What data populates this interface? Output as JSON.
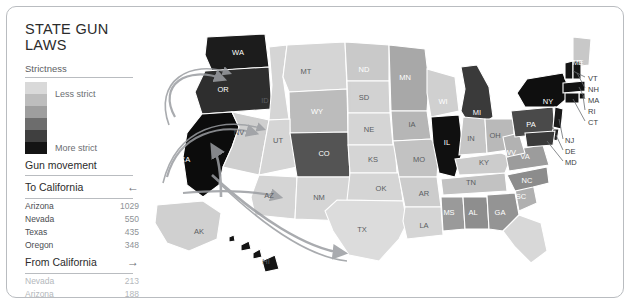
{
  "title": "STATE GUN LAWS",
  "legend": {
    "heading": "Strictness",
    "less_label": "Less strict",
    "more_label": "More strict",
    "ramp_colors": [
      "#d9d9d9",
      "#bdbdbd",
      "#9e9e9e",
      "#6d6d6d",
      "#3f3f3f",
      "#141414"
    ]
  },
  "movement": {
    "heading": "Gun movement",
    "to": {
      "label": "To California",
      "arrow": "←",
      "rows": [
        {
          "name": "Arizona",
          "value": "1029"
        },
        {
          "name": "Nevada",
          "value": "550"
        },
        {
          "name": "Texas",
          "value": "435"
        },
        {
          "name": "Oregon",
          "value": "348"
        }
      ]
    },
    "from": {
      "label": "From California",
      "arrow": "→",
      "rows": [
        {
          "name": "Nevada",
          "value": "213"
        },
        {
          "name": "Arizona",
          "value": "188"
        },
        {
          "name": "Oregon",
          "value": "124"
        },
        {
          "name": "Texas",
          "value": "106"
        }
      ]
    }
  },
  "map": {
    "ocean_color": "#ffffff",
    "state_labels": [
      {
        "code": "WA",
        "x": 231,
        "y": 45,
        "tone": "lt"
      },
      {
        "code": "OR",
        "x": 216,
        "y": 82,
        "tone": "lt"
      },
      {
        "code": "CA",
        "x": 178,
        "y": 152,
        "tone": "lt"
      },
      {
        "code": "NV",
        "x": 232,
        "y": 125,
        "tone": "dk"
      },
      {
        "code": "ID",
        "x": 258,
        "y": 93,
        "tone": "dk"
      },
      {
        "code": "MT",
        "x": 299,
        "y": 64,
        "tone": "dk"
      },
      {
        "code": "WY",
        "x": 310,
        "y": 104,
        "tone": "lt"
      },
      {
        "code": "UT",
        "x": 271,
        "y": 133,
        "tone": "dk"
      },
      {
        "code": "CO",
        "x": 317,
        "y": 146,
        "tone": "lt"
      },
      {
        "code": "AZ",
        "x": 262,
        "y": 188,
        "tone": "dk"
      },
      {
        "code": "NM",
        "x": 312,
        "y": 190,
        "tone": "dk"
      },
      {
        "code": "ND",
        "x": 357,
        "y": 62,
        "tone": "lt"
      },
      {
        "code": "SD",
        "x": 357,
        "y": 90,
        "tone": "dk"
      },
      {
        "code": "NE",
        "x": 362,
        "y": 122,
        "tone": "dk"
      },
      {
        "code": "KS",
        "x": 366,
        "y": 152,
        "tone": "dk"
      },
      {
        "code": "OK",
        "x": 374,
        "y": 181,
        "tone": "dk"
      },
      {
        "code": "TX",
        "x": 355,
        "y": 222,
        "tone": "dk"
      },
      {
        "code": "MN",
        "x": 398,
        "y": 70,
        "tone": "lt"
      },
      {
        "code": "IA",
        "x": 405,
        "y": 117,
        "tone": "dk"
      },
      {
        "code": "MO",
        "x": 412,
        "y": 152,
        "tone": "dk"
      },
      {
        "code": "AR",
        "x": 417,
        "y": 186,
        "tone": "dk"
      },
      {
        "code": "LA",
        "x": 417,
        "y": 218,
        "tone": "dk"
      },
      {
        "code": "WI",
        "x": 436,
        "y": 94,
        "tone": "lt"
      },
      {
        "code": "IL",
        "x": 440,
        "y": 135,
        "tone": "lt"
      },
      {
        "code": "MI",
        "x": 470,
        "y": 105,
        "tone": "lt"
      },
      {
        "code": "IN",
        "x": 464,
        "y": 131,
        "tone": "dk"
      },
      {
        "code": "OH",
        "x": 488,
        "y": 128,
        "tone": "dk"
      },
      {
        "code": "KY",
        "x": 477,
        "y": 155,
        "tone": "dk"
      },
      {
        "code": "TN",
        "x": 464,
        "y": 175,
        "tone": "dk"
      },
      {
        "code": "MS",
        "x": 442,
        "y": 205,
        "tone": "lt"
      },
      {
        "code": "AL",
        "x": 466,
        "y": 205,
        "tone": "lt"
      },
      {
        "code": "GA",
        "x": 493,
        "y": 205,
        "tone": "lt"
      },
      {
        "code": "SC",
        "x": 514,
        "y": 189,
        "tone": "lt"
      },
      {
        "code": "NC",
        "x": 520,
        "y": 173,
        "tone": "lt"
      },
      {
        "code": "VA",
        "x": 518,
        "y": 149,
        "tone": "lt"
      },
      {
        "code": "WV",
        "x": 503,
        "y": 145,
        "tone": "lt"
      },
      {
        "code": "PA",
        "x": 524,
        "y": 117,
        "tone": "lt"
      },
      {
        "code": "NY",
        "x": 541,
        "y": 94,
        "tone": "lt"
      },
      {
        "code": "ME",
        "x": 571,
        "y": 55,
        "tone": "lt"
      },
      {
        "code": "AK",
        "x": 192,
        "y": 224,
        "tone": "dk"
      },
      {
        "code": "HI",
        "x": 259,
        "y": 254,
        "tone": "dk"
      }
    ],
    "callouts": [
      {
        "code": "VT",
        "x": 581,
        "y": 72
      },
      {
        "code": "NH",
        "x": 581,
        "y": 83
      },
      {
        "code": "MA",
        "x": 581,
        "y": 94
      },
      {
        "code": "RI",
        "x": 581,
        "y": 105
      },
      {
        "code": "CT",
        "x": 581,
        "y": 116
      },
      {
        "code": "NJ",
        "x": 558,
        "y": 134
      },
      {
        "code": "DE",
        "x": 558,
        "y": 145
      },
      {
        "code": "MD",
        "x": 558,
        "y": 156
      }
    ]
  }
}
